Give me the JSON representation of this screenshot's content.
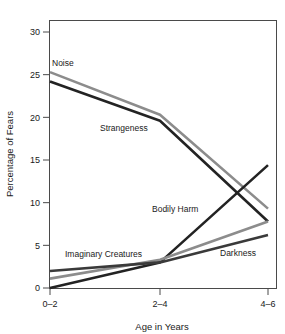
{
  "chart_data": {
    "type": "line",
    "title": "",
    "xlabel": "Age in Years",
    "ylabel": "Percentage of Fears",
    "categories": [
      "0–2",
      "2–4",
      "4–6"
    ],
    "ylim": [
      0,
      30
    ],
    "yticks": [
      0,
      5,
      10,
      15,
      20,
      25,
      30
    ],
    "ytick_labels": [
      "0",
      "5",
      "10",
      "15",
      "20",
      "25",
      "30"
    ],
    "grid": false,
    "legend": "inline-labels",
    "series": [
      {
        "name": "Noise",
        "values": [
          25.3,
          20.3,
          9.3
        ],
        "color": "#8c8c8c",
        "width": 2.6
      },
      {
        "name": "Strangeness",
        "values": [
          24.2,
          19.6,
          7.8
        ],
        "color": "#232323",
        "width": 2.6
      },
      {
        "name": "Bodily Harm",
        "values": [
          0.0,
          3.0,
          14.4
        ],
        "color": "#232323",
        "width": 2.6
      },
      {
        "name": "Imaginary Creatures",
        "values": [
          1.1,
          3.3,
          7.8
        ],
        "color": "#8c8c8c",
        "width": 2.6
      },
      {
        "name": "Darkness",
        "values": [
          2.0,
          3.0,
          6.2
        ],
        "color": "#3a3a3a",
        "width": 2.6
      }
    ],
    "annotations": [
      {
        "text": "Noise",
        "x": 52,
        "y": 66
      },
      {
        "text": "Strangeness",
        "x": 100,
        "y": 131
      },
      {
        "text": "Bodily Harm",
        "x": 152,
        "y": 212
      },
      {
        "text": "Imaginary Creatures",
        "x": 65,
        "y": 257
      },
      {
        "text": "Darkness",
        "x": 220,
        "y": 256
      }
    ]
  },
  "axis": {
    "x_title": "Age in Years",
    "y_title": "Percentage of Fears"
  },
  "colors": {
    "frame": "#4a4a4a",
    "dark_series": "#232323",
    "gray_series": "#8c8c8c",
    "background": "#ffffff"
  },
  "ghost_title_text": ""
}
